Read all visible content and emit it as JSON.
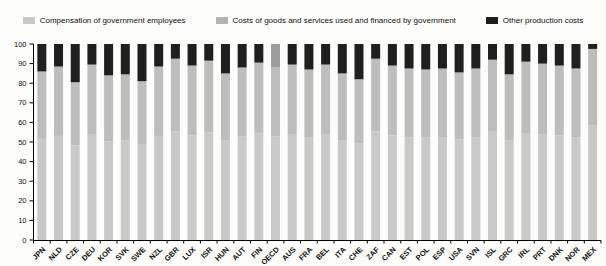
{
  "legend": {
    "items": [
      {
        "label": "Compensation of government employees",
        "color": "#c9c9c9"
      },
      {
        "label": "Costs of goods and services used and financed by government",
        "color": "#b3b3b3"
      },
      {
        "label": "Other production costs",
        "color": "#1f1f1f"
      }
    ]
  },
  "chart_data": {
    "type": "bar",
    "subtype": "stacked-percentage",
    "title": "",
    "xlabel": "",
    "ylabel": "",
    "ylim": [
      0,
      100
    ],
    "yticks": [
      0,
      10,
      20,
      30,
      40,
      50,
      60,
      70,
      80,
      90,
      100
    ],
    "grid": false,
    "legend_position": "top",
    "categories": [
      "JPN",
      "NLD",
      "CZE",
      "DEU",
      "KOR",
      "SVK",
      "SWE",
      "NZL",
      "GBR",
      "LUX",
      "ISR",
      "HUN",
      "AUT",
      "FIN",
      "OECD",
      "AUS",
      "FRA",
      "BEL",
      "ITA",
      "CHE",
      "ZAF",
      "CAN",
      "EST",
      "POL",
      "ESP",
      "USA",
      "SVN",
      "ISL",
      "GRC",
      "IRL",
      "PRT",
      "DNK",
      "NOR",
      "MEX"
    ],
    "series": [
      {
        "name": "Compensation of government employees",
        "color": "#c9c9c9",
        "values": [
          51.6,
          53.1,
          48.3,
          53.7,
          50.4,
          50.7,
          48.6,
          53.1,
          55.5,
          53.4,
          54.9,
          51.0,
          52.8,
          54.3,
          52.8,
          53.7,
          52.2,
          53.7,
          51.0,
          49.2,
          55.5,
          53.4,
          52.5,
          52.2,
          52.5,
          51.3,
          52.5,
          55.2,
          50.7,
          54.6,
          54.0,
          53.4,
          52.5,
          58.5
        ]
      },
      {
        "name": "Costs of goods and services used and financed by government",
        "color": "#bdbdbd",
        "values": [
          34.4,
          35.4,
          32.2,
          35.8,
          33.6,
          33.8,
          32.4,
          35.4,
          37.0,
          35.6,
          36.6,
          34.0,
          35.2,
          36.2,
          35.2,
          35.8,
          34.8,
          35.8,
          34.0,
          32.8,
          37.0,
          35.6,
          35.0,
          34.8,
          35.0,
          34.2,
          35.0,
          36.8,
          33.8,
          36.4,
          36.0,
          35.6,
          35.0,
          39.0
        ]
      },
      {
        "name": "Other production costs",
        "color": "#1f1f1f",
        "values": [
          14.0,
          11.5,
          19.5,
          10.5,
          16.0,
          15.5,
          19.0,
          11.5,
          7.5,
          11.0,
          8.5,
          15.0,
          12.0,
          9.5,
          12.0,
          10.5,
          13.0,
          10.5,
          15.0,
          18.0,
          7.5,
          11.0,
          12.5,
          13.0,
          12.5,
          14.5,
          12.5,
          8.0,
          15.5,
          9.0,
          10.0,
          11.0,
          12.5,
          2.5
        ]
      }
    ],
    "overrides": {
      "OECD": {
        "other_color": "#9c9c9c"
      }
    },
    "axis_color": "#000000"
  }
}
